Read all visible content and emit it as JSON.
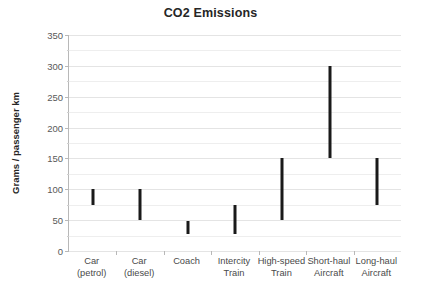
{
  "chart_data": {
    "type": "bar",
    "subtype": "floating-range-bar",
    "title": "CO2 Emissions",
    "xlabel": "",
    "ylabel": "Grams / passenger km",
    "ylim": [
      0,
      350
    ],
    "ytick_step": 50,
    "yticks": [
      0,
      50,
      100,
      150,
      200,
      250,
      300,
      350
    ],
    "ytick_labels": [
      "0",
      "50",
      "100",
      "150",
      "200",
      "250",
      "300",
      "350"
    ],
    "grid": true,
    "legend": "none",
    "categories": [
      "Car (petrol)",
      "Car (diesel)",
      "Coach",
      "Intercity Train",
      "High-speed Train",
      "Short-haul Aircraft",
      "Long-haul Aircraft"
    ],
    "category_lines": [
      [
        "Car",
        "(petrol)"
      ],
      [
        "Car",
        "(diesel)"
      ],
      [
        "Coach",
        ""
      ],
      [
        "Intercity",
        "Train"
      ],
      [
        "High-speed",
        "Train"
      ],
      [
        "Short-haul",
        "Aircraft"
      ],
      [
        "Long-haul",
        "Aircraft"
      ]
    ],
    "series": [
      {
        "name": "low",
        "values": [
          75,
          50,
          27,
          27,
          50,
          150,
          75
        ]
      },
      {
        "name": "high",
        "values": [
          100,
          100,
          48,
          75,
          150,
          300,
          150
        ]
      }
    ],
    "bar_color": "#1a1a1a",
    "grid_color": "#eeeeee",
    "axis_color": "#b8b8b8"
  },
  "labels": {
    "title": "CO2 Emissions",
    "ylabel": "Grams / passenger km"
  }
}
